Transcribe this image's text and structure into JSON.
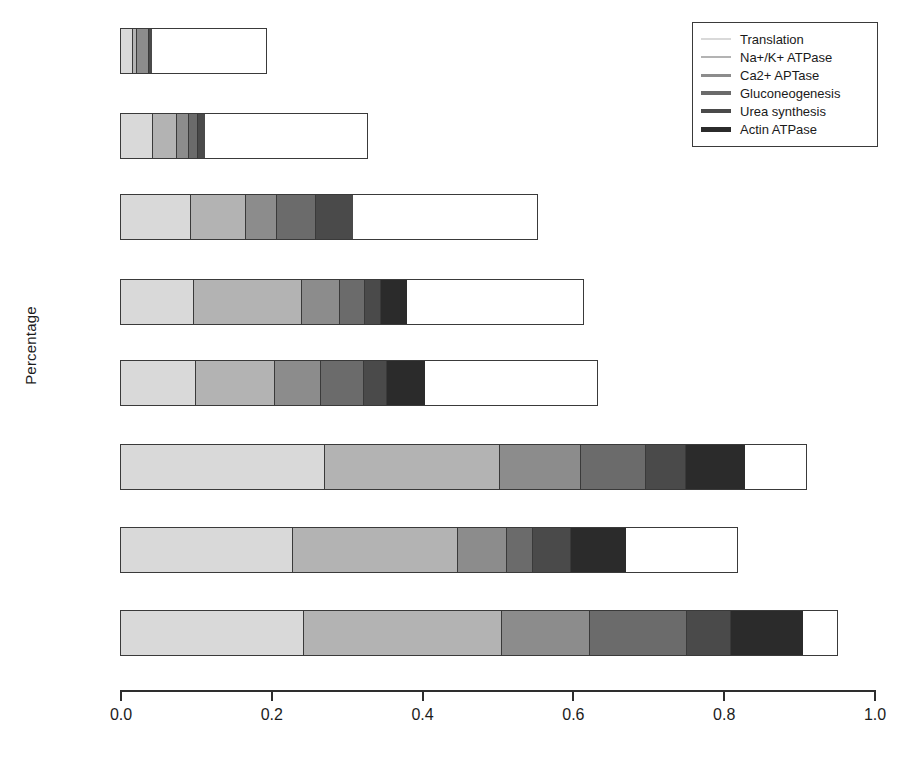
{
  "chart_data": {
    "type": "bar",
    "orientation": "horizontal",
    "stacked": true,
    "title": "",
    "xlabel": "",
    "ylabel": "Percentage",
    "xlim": [
      0.0,
      1.0
    ],
    "xticks": [
      0.0,
      0.2,
      0.4,
      0.6,
      0.8,
      1.0
    ],
    "xtick_labels": [
      "0.0",
      "0.2",
      "0.4",
      "0.6",
      "0.8",
      "1.0"
    ],
    "ytick_labels": [
      "",
      "",
      "",
      "",
      "",
      "",
      "",
      ""
    ],
    "grid": false,
    "legend_position": "top-right",
    "series": [
      {
        "name": "Translation",
        "color": "#d9d9d9",
        "values": [
          0.077,
          0.126,
          0.167,
          0.157,
          0.158,
          0.298,
          0.28,
          0.256
        ]
      },
      {
        "name": "Na+/K+ ATPase",
        "color": "#b3b3b3",
        "values": [
          0.02,
          0.098,
          0.131,
          0.235,
          0.164,
          0.256,
          0.268,
          0.277
        ]
      },
      {
        "name": "Ca2+ APTase",
        "color": "#8c8c8c",
        "values": [
          0.077,
          0.044,
          0.073,
          0.081,
          0.097,
          0.118,
          0.08,
          0.123
        ]
      },
      {
        "name": "Gluconeogenesis",
        "color": "#6b6b6b",
        "values": [
          0.0,
          0.033,
          0.093,
          0.053,
          0.089,
          0.094,
          0.04,
          0.135
        ]
      },
      {
        "name": "Urea synthesis",
        "color": "#4a4a4a",
        "values": [
          0.021,
          0.028,
          0.09,
          0.032,
          0.046,
          0.057,
          0.061,
          0.06
        ]
      },
      {
        "name": "Actin ATPase",
        "color": "#2b2b2b",
        "values": [
          0.0,
          0.0,
          0.0,
          0.057,
          0.08,
          0.088,
          0.09,
          0.101
        ]
      }
    ],
    "bar_totals": [
      0.195,
      0.329,
      0.554,
      0.615,
      0.634,
      0.911,
      0.819,
      0.952
    ]
  },
  "legend": {
    "entries": [
      {
        "label": "Translation"
      },
      {
        "label": "Na+/K+ ATPase"
      },
      {
        "label": "Ca2+ APTase"
      },
      {
        "label": "Gluconeogenesis"
      },
      {
        "label": "Urea synthesis"
      },
      {
        "label": "Actin ATPase"
      }
    ]
  },
  "axis": {
    "y_title": "Percentage",
    "x_tick_labels": [
      "0.0",
      "0.2",
      "0.4",
      "0.6",
      "0.8",
      "1.0"
    ]
  }
}
